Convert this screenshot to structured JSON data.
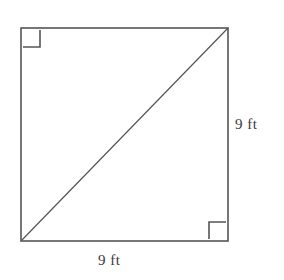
{
  "figure": {
    "name": "square-with-diagonal",
    "background_color": "#ffffff",
    "stroke_color": "#555555",
    "text_color": "#3a3a3a",
    "shape": {
      "type": "square",
      "x": 21,
      "y": 28,
      "width": 207,
      "height": 213
    },
    "diagonal": {
      "x1": 21,
      "y1": 241,
      "x2": 228,
      "y2": 28
    },
    "right_angle_markers": [
      {
        "corner": "top-left",
        "x": 23,
        "y": 30,
        "size": 17
      },
      {
        "corner": "bottom-right",
        "x": 209,
        "y": 222,
        "size": 17
      }
    ],
    "labels": {
      "right_side": "9 ft",
      "bottom_side": "9 ft"
    }
  }
}
